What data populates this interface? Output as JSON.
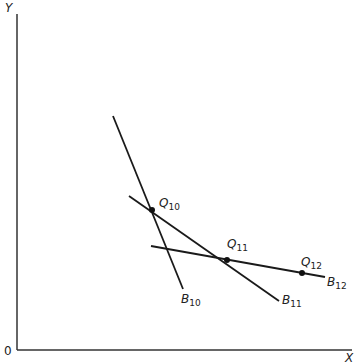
{
  "diagram": {
    "axes": {
      "x_label": "X",
      "y_label": "Y",
      "origin_label": "0"
    },
    "lines": [
      {
        "id": "B10",
        "main": "B",
        "sub": "10",
        "x1": 113,
        "y1": 116,
        "x2": 183,
        "y2": 289
      },
      {
        "id": "B11",
        "main": "B",
        "sub": "11",
        "x1": 129,
        "y1": 196,
        "x2": 279,
        "y2": 301
      },
      {
        "id": "B12",
        "main": "B",
        "sub": "12",
        "x1": 151,
        "y1": 246,
        "x2": 325,
        "y2": 277
      }
    ],
    "points": [
      {
        "id": "Q10",
        "main": "Q",
        "sub": "10",
        "x": 152,
        "y": 210
      },
      {
        "id": "Q11",
        "main": "Q",
        "sub": "11",
        "x": 227,
        "y": 260
      },
      {
        "id": "Q12",
        "main": "Q",
        "sub": "12",
        "x": 302,
        "y": 273
      }
    ],
    "colors": {
      "line": "#1a1a1a",
      "axis": "#333333",
      "background": "#ffffff"
    }
  }
}
